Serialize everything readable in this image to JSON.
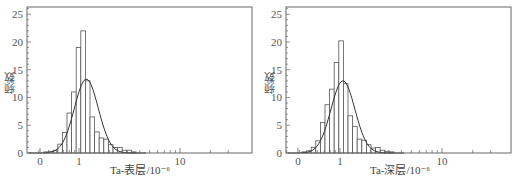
{
  "chart_data": [
    {
      "type": "bar",
      "subtype": "histogram_with_normal_fit",
      "title": "",
      "xlabel": "Ta-表层/10⁻⁶",
      "ylabel": "频数",
      "ylim": [
        0,
        26.3
      ],
      "yticks": [
        0,
        5,
        10,
        15,
        20,
        25
      ],
      "xscale": "log",
      "xtick_labels": [
        "0",
        "1",
        "10"
      ],
      "grid": false,
      "legend": null,
      "bin_count": 20,
      "values": [
        0.2,
        0.3,
        0.5,
        1.6,
        3.7,
        7.2,
        11.0,
        19.0,
        22.0,
        13.0,
        6.5,
        3.8,
        2.7,
        2.5,
        1.5,
        1.0,
        1.0,
        0.5,
        0.5,
        0.2
      ],
      "fit_curve": {
        "type": "normal",
        "peak": 13.3,
        "peak_bin_index": 9.2,
        "sigma_bins": 2.6
      }
    },
    {
      "type": "bar",
      "subtype": "histogram_with_normal_fit",
      "title": "",
      "xlabel": "Ta-深层/10⁻⁶",
      "ylabel": "频数",
      "ylim": [
        0,
        26.3
      ],
      "yticks": [
        0,
        5,
        10,
        15,
        20,
        25
      ],
      "xscale": "log",
      "xtick_labels": [
        "0",
        "1",
        "10"
      ],
      "grid": false,
      "legend": null,
      "bin_count": 20,
      "values": [
        0.2,
        0.4,
        1.0,
        2.2,
        5.5,
        8.7,
        11.5,
        16.3,
        20.2,
        12.5,
        6.7,
        4.8,
        2.5,
        2.3,
        1.5,
        0.9,
        1.0,
        0.5,
        0.3,
        0.2
      ],
      "fit_curve": {
        "type": "normal",
        "peak": 13.0,
        "peak_bin_index": 8.9,
        "sigma_bins": 2.6
      }
    }
  ],
  "charts": [
    {
      "xlabel": "Ta-表层/10⁻⁶",
      "ylabel": "频数"
    },
    {
      "xlabel": "Ta-深层/10⁻⁶",
      "ylabel": "频数"
    }
  ],
  "colors": {
    "bar_stroke": "#555555",
    "curve": "#333333",
    "axis": "#666666",
    "bar_fill": "#ffffff"
  }
}
